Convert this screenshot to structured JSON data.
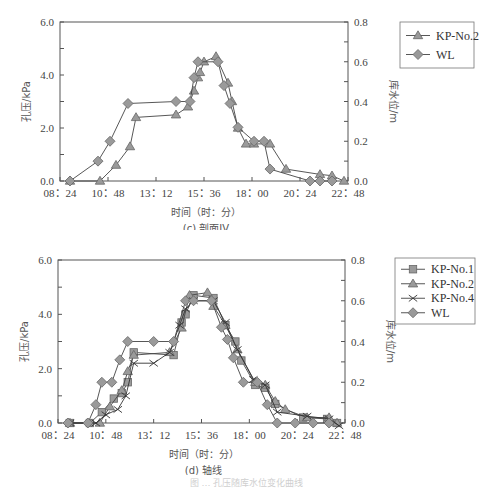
{
  "figure_caption": "图 … 孔压随库水位变化曲线",
  "chart_data": [
    {
      "id": "c",
      "type": "line",
      "subtitle": "(c) 剖面IV",
      "xlabel": "时间（时：分）",
      "ylabel": "孔压/kPa",
      "y2label": "库水位/m",
      "x_ticks": [
        "08：24",
        "10：48",
        "13：12",
        "15：36",
        "18：00",
        "20：24",
        "22：48"
      ],
      "x_range_hours": [
        8.4,
        22.8
      ],
      "ylim": [
        0,
        6
      ],
      "y_ticks": [
        "0.0",
        "2.0",
        "4.0",
        "6.0"
      ],
      "y2lim": [
        0,
        0.8
      ],
      "y2_ticks": [
        "0.0",
        "0.2",
        "0.4",
        "0.6",
        "0.8"
      ],
      "grid": false,
      "legend_position": "right-top",
      "legend": [
        "KP-No.2",
        "WL"
      ],
      "series": [
        {
          "name": "KP-No.2",
          "marker": "triangle",
          "axis": "left",
          "x": [
            8.9,
            10.4,
            11.2,
            11.9,
            12.2,
            14.2,
            14.8,
            15.1,
            15.3,
            15.4,
            15.6,
            16.2,
            16.8,
            17.0,
            17.3,
            17.7,
            18.1,
            18.9,
            19.7,
            21.4,
            22.0,
            22.6
          ],
          "y": [
            0.0,
            0.0,
            0.6,
            1.3,
            2.4,
            2.5,
            2.8,
            3.4,
            3.9,
            4.1,
            4.5,
            4.7,
            3.7,
            3.0,
            2.0,
            1.4,
            1.4,
            1.4,
            0.45,
            0.25,
            0.2,
            0.0
          ]
        },
        {
          "name": "WL",
          "marker": "diamond",
          "axis": "right",
          "x": [
            8.9,
            10.3,
            10.9,
            11.8,
            14.2,
            14.9,
            15.1,
            15.3,
            16.3,
            16.6,
            16.9,
            17.3,
            18.1,
            18.6,
            18.9,
            20.9,
            21.4,
            22.0
          ],
          "y": [
            0.0,
            0.1,
            0.2,
            0.39,
            0.4,
            0.4,
            0.52,
            0.6,
            0.6,
            0.48,
            0.39,
            0.27,
            0.2,
            0.2,
            0.06,
            0.0,
            0.0,
            0.0
          ]
        }
      ]
    },
    {
      "id": "d",
      "type": "line",
      "subtitle": "(d) 轴线",
      "xlabel": "时间（时：分）",
      "ylabel": "孔压/kPa",
      "y2label": "库水位/m",
      "x_ticks": [
        "08：24",
        "10：48",
        "13：12",
        "15：36",
        "18：00",
        "20：24",
        "22：48"
      ],
      "x_range_hours": [
        8.4,
        22.8
      ],
      "ylim": [
        0,
        6
      ],
      "y_ticks": [
        "0.0",
        "2.0",
        "4.0",
        "6.0"
      ],
      "y2lim": [
        0,
        0.8
      ],
      "y2_ticks": [
        "0.0",
        "0.2",
        "0.4",
        "0.6",
        "0.8"
      ],
      "grid": false,
      "legend_position": "right-top",
      "legend": [
        "KP-No.1",
        "KP-No.2",
        "KP-No.4",
        "WL"
      ],
      "series": [
        {
          "name": "KP-No.1",
          "marker": "square",
          "axis": "left",
          "x": [
            9.0,
            10.0,
            10.6,
            11.2,
            11.6,
            11.9,
            12.2,
            14.2,
            14.6,
            14.8,
            15.2,
            16.2,
            16.8,
            17.3,
            17.6,
            18.3,
            18.8,
            19.3,
            20.7,
            21.9,
            22.4
          ],
          "y": [
            0.0,
            0.0,
            0.4,
            0.9,
            1.1,
            1.5,
            2.6,
            2.5,
            3.7,
            4.0,
            4.7,
            4.6,
            3.6,
            3.0,
            2.3,
            1.4,
            1.3,
            0.7,
            0.2,
            0.15,
            0.0
          ],
          "color": "#999999"
        },
        {
          "name": "KP-No.2",
          "marker": "triangle",
          "axis": "left",
          "x": [
            9.0,
            10.5,
            11.0,
            11.6,
            11.9,
            12.2,
            14.0,
            14.6,
            15.0,
            15.9,
            16.2,
            16.8,
            17.4,
            18.3,
            18.8,
            19.3,
            19.8,
            20.9,
            22.0,
            22.4
          ],
          "y": [
            0.0,
            0.0,
            0.6,
            1.2,
            1.9,
            2.5,
            2.6,
            3.5,
            4.7,
            4.8,
            4.3,
            3.6,
            2.7,
            1.5,
            1.4,
            0.8,
            0.5,
            0.2,
            0.2,
            0.0
          ],
          "color": "#999999"
        },
        {
          "name": "KP-No.4",
          "marker": "x",
          "axis": "left",
          "x": [
            9.0,
            10.3,
            10.8,
            11.4,
            11.8,
            12.2,
            13.2,
            14.0,
            14.5,
            14.8,
            15.2,
            16.2,
            16.8,
            17.4,
            18.2,
            18.8,
            19.4,
            20.9,
            22.0,
            22.5
          ],
          "y": [
            0.0,
            0.0,
            0.3,
            0.5,
            1.0,
            2.2,
            2.2,
            2.6,
            3.6,
            4.2,
            4.5,
            4.5,
            3.7,
            2.7,
            1.6,
            1.4,
            0.4,
            0.25,
            0.15,
            -0.1
          ],
          "color": "#333333"
        },
        {
          "name": "WL",
          "marker": "diamond",
          "axis": "right",
          "x": [
            8.9,
            9.9,
            10.3,
            10.6,
            11.1,
            11.5,
            11.9,
            13.2,
            14.2,
            14.8,
            15.2,
            16.1,
            16.6,
            16.9,
            17.2,
            17.7,
            18.4,
            18.9,
            19.4,
            20.3,
            21.2,
            22.0
          ],
          "y": [
            0.0,
            0.0,
            0.09,
            0.2,
            0.2,
            0.31,
            0.4,
            0.4,
            0.4,
            0.6,
            0.6,
            0.6,
            0.47,
            0.41,
            0.32,
            0.2,
            0.2,
            0.09,
            0.0,
            0.0,
            0.0,
            0.0
          ],
          "color": "#999999"
        }
      ]
    }
  ],
  "charts_layout": [
    {
      "top": 0,
      "height": 230,
      "plot": {
        "left": 60,
        "right": 348,
        "top": 22,
        "bottom": 181
      },
      "legend": {
        "x": 400,
        "y": 22,
        "w": 74,
        "h": 46
      },
      "xlabel_y": 216,
      "subtitle_y": 232
    },
    {
      "top": 240,
      "height": 235,
      "plot": {
        "left": 58,
        "right": 345,
        "top": 20,
        "bottom": 183
      },
      "legend": {
        "x": 395,
        "y": 18,
        "w": 80,
        "h": 66
      },
      "xlabel_y": 218,
      "subtitle_y": 234
    }
  ],
  "style": {
    "marker_fill": "#9a9a9a",
    "marker_stroke": "#666666",
    "line_color": "#444444",
    "axis_color": "#555555"
  }
}
